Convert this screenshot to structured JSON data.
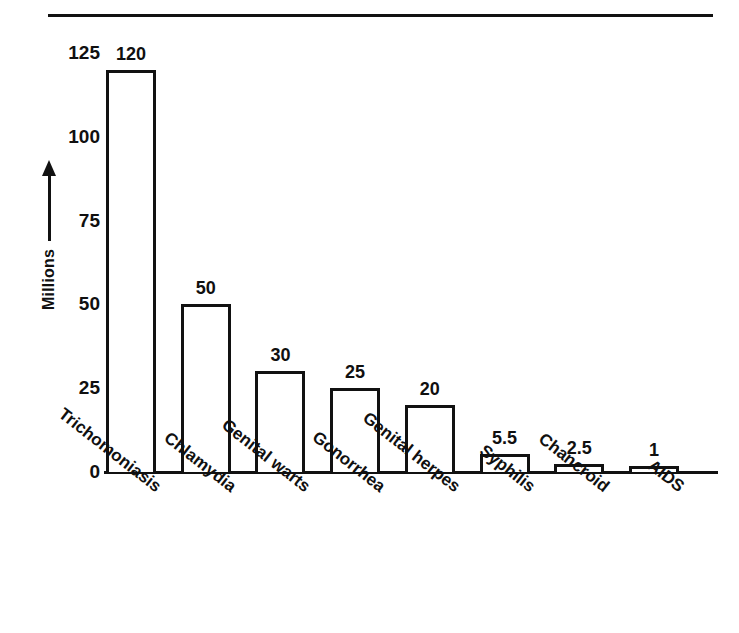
{
  "figure": {
    "rule_present": true
  },
  "chart_data": {
    "type": "bar",
    "title": "",
    "xlabel": "",
    "ylabel": "Millions",
    "ylim": [
      0,
      125
    ],
    "yticks": [
      0,
      25,
      50,
      75,
      100,
      125
    ],
    "ytick_labels": [
      "0",
      "25",
      "50",
      "75",
      "100",
      "125"
    ],
    "grid": false,
    "legend": null,
    "categories": [
      "Trichomoniasis",
      "Chlamydia",
      "Genital warts",
      "Gonorrhea",
      "Genital herpes",
      "Syphilis",
      "Chancroid",
      "AIDS"
    ],
    "values": [
      120,
      50,
      30,
      25,
      20,
      5.5,
      2.5,
      1
    ],
    "value_labels": [
      "120",
      "50",
      "30",
      "25",
      "20",
      "5.5",
      "2.5",
      "1"
    ],
    "bar_fill": "#ffffff",
    "bar_edge": "#111111",
    "axis_color": "#111111",
    "background": "#ffffff"
  }
}
